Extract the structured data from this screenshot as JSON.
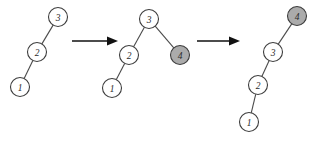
{
  "figure": {
    "background_color": "#ffffff",
    "width": 325,
    "height": 145,
    "node_stroke_color": "#3d3d3d",
    "node_fill_plain": "#ffffff",
    "node_fill_shaded": "#ababab",
    "edge_color": "#4a4a4a",
    "arrow_color": "#111111",
    "node_radius": 9.5
  },
  "steps": [
    {
      "name": "step-1-initial-tree",
      "caption": "",
      "nodes": [
        {
          "id": "s1-n3",
          "label": "3",
          "cx": 58,
          "cy": 17,
          "shaded": false
        },
        {
          "id": "s1-n2",
          "label": "2",
          "cx": 37,
          "cy": 52,
          "shaded": false
        },
        {
          "id": "s1-n1",
          "label": "1",
          "cx": 20,
          "cy": 87,
          "shaded": false
        }
      ],
      "edges": [
        {
          "from": "s1-n3",
          "to": "s1-n2"
        },
        {
          "from": "s1-n2",
          "to": "s1-n1"
        }
      ]
    },
    {
      "name": "step-2-after-insert-4",
      "caption": "",
      "nodes": [
        {
          "id": "s2-n3",
          "label": "3",
          "cx": 149,
          "cy": 19,
          "shaded": false
        },
        {
          "id": "s2-n2",
          "label": "2",
          "cx": 129,
          "cy": 55,
          "shaded": false
        },
        {
          "id": "s2-n4",
          "label": "4",
          "cx": 180,
          "cy": 55,
          "shaded": true
        },
        {
          "id": "s2-n1",
          "label": "1",
          "cx": 112,
          "cy": 88,
          "shaded": false
        }
      ],
      "edges": [
        {
          "from": "s2-n3",
          "to": "s2-n2"
        },
        {
          "from": "s2-n3",
          "to": "s2-n4"
        },
        {
          "from": "s2-n2",
          "to": "s2-n1"
        }
      ]
    },
    {
      "name": "step-3-final-tree",
      "caption": "",
      "nodes": [
        {
          "id": "s3-n4",
          "label": "4",
          "cx": 297,
          "cy": 16,
          "shaded": true
        },
        {
          "id": "s3-n3",
          "label": "3",
          "cx": 273,
          "cy": 52,
          "shaded": false
        },
        {
          "id": "s3-n2",
          "label": "2",
          "cx": 258,
          "cy": 85,
          "shaded": false
        },
        {
          "id": "s3-n1",
          "label": "1",
          "cx": 249,
          "cy": 122,
          "shaded": false
        }
      ],
      "edges": [
        {
          "from": "s3-n4",
          "to": "s3-n3"
        },
        {
          "from": "s3-n3",
          "to": "s3-n2"
        },
        {
          "from": "s3-n2",
          "to": "s3-n1"
        }
      ]
    }
  ],
  "arrows": [
    {
      "name": "arrow-step1-to-step2",
      "x1": 72,
      "y1": 41,
      "x2": 118,
      "y2": 41
    },
    {
      "name": "arrow-step2-to-step3",
      "x1": 197,
      "y1": 41,
      "x2": 240,
      "y2": 41
    }
  ]
}
